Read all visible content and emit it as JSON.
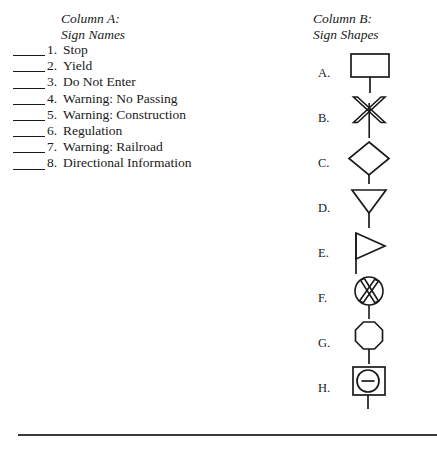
{
  "worksheet": {
    "column_a": {
      "header_line1": "Column A:",
      "header_line2": "Sign Names",
      "items": [
        {
          "number": "1.",
          "label": "Stop"
        },
        {
          "number": "2.",
          "label": "Yield"
        },
        {
          "number": "3.",
          "label": "Do Not Enter"
        },
        {
          "number": "4.",
          "label": "Warning: No Passing"
        },
        {
          "number": "5.",
          "label": "Warning: Construction"
        },
        {
          "number": "6.",
          "label": "Regulation"
        },
        {
          "number": "7.",
          "label": "Warning: Railroad"
        },
        {
          "number": "8.",
          "label": "Directional Information"
        }
      ]
    },
    "column_b": {
      "header_line1": "Column B:",
      "header_line2": "Sign Shapes",
      "items": [
        {
          "letter": "A.",
          "shape": "rectangle-sign-on-post"
        },
        {
          "letter": "B.",
          "shape": "crossbuck-sign-on-post"
        },
        {
          "letter": "C.",
          "shape": "diamond-sign-on-post"
        },
        {
          "letter": "D.",
          "shape": "inverted-triangle-sign-on-post"
        },
        {
          "letter": "E.",
          "shape": "pennant-sign-on-post"
        },
        {
          "letter": "F.",
          "shape": "circle-with-crossbuck-sign-on-post"
        },
        {
          "letter": "G.",
          "shape": "octagon-sign-on-post"
        },
        {
          "letter": "H.",
          "shape": "square-with-circle-and-bar-sign-on-post"
        }
      ]
    },
    "colors": {
      "ink": "#1a1a1a",
      "rule": "#3a3a3a",
      "background": "#ffffff"
    }
  }
}
